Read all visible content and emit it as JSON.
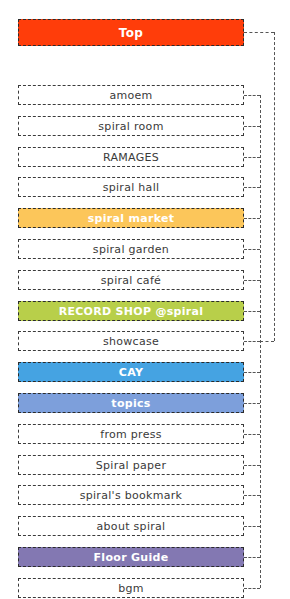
{
  "top": {
    "label": "Top",
    "color": "#ff3d0a"
  },
  "items": [
    {
      "label": "amoem",
      "color": null
    },
    {
      "label": "spiral room",
      "color": null
    },
    {
      "label": "RAMAGES",
      "color": null
    },
    {
      "label": "spiral hall",
      "color": null
    },
    {
      "label": "spiral market",
      "color": "#fcc65a"
    },
    {
      "label": "spiral garden",
      "color": null
    },
    {
      "label": "spiral café",
      "color": null
    },
    {
      "label": "RECORD SHOP @spiral",
      "color": "#b8cf4a"
    },
    {
      "label": "showcase",
      "color": null
    },
    {
      "label": "CAY",
      "color": "#45a3e2"
    },
    {
      "label": "topics",
      "color": "#7d9fdb"
    },
    {
      "label": "from press",
      "color": null
    },
    {
      "label": "Spiral paper",
      "color": null
    },
    {
      "label": "spiral's bookmark",
      "color": null
    },
    {
      "label": "about spiral",
      "color": null
    },
    {
      "label": "Floor Guide",
      "color": "#8378b2"
    },
    {
      "label": "bgm",
      "color": null
    }
  ]
}
